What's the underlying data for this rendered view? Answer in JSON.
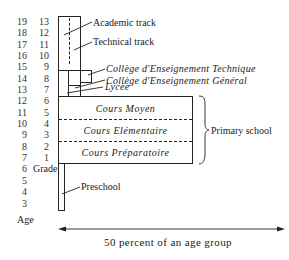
{
  "axis": {
    "ages": [
      "19",
      "18",
      "17",
      "16",
      "15",
      "14",
      "13",
      "12",
      "11",
      "10",
      "9",
      "8",
      "7",
      "6",
      "5",
      "4",
      "3"
    ],
    "grades": [
      "13",
      "12",
      "11",
      "10",
      "9",
      "8",
      "7",
      "6",
      "5",
      "4",
      "3",
      "2",
      "1"
    ],
    "age_label": "Age",
    "grade_label": "Grade"
  },
  "secondary": {
    "academic_track": "Academic track",
    "technical_track": "Technical track",
    "college_technique": "Collège d'Enseignement Technique",
    "college_general": "Collège d'Enseignement Général",
    "lycee": "Lycée"
  },
  "primary": {
    "cours_moyen": "Cours Moyen",
    "cours_elementaire": "Cours Elémentaire",
    "cours_preparatoire": "Cours Préparatoire",
    "bracket_label": "Primary school"
  },
  "preschool": {
    "label": "Preschool"
  },
  "scale": {
    "label": "50 percent of an age group"
  },
  "colors": {
    "line": "#222222",
    "background": "#ffffff"
  }
}
